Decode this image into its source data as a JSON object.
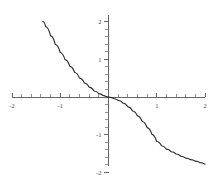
{
  "chart_data": {
    "type": "line",
    "title": "",
    "subtitle": "",
    "xlabel": "",
    "ylabel": "",
    "xlim": [
      -2,
      2
    ],
    "ylim": [
      -2,
      2
    ],
    "grid": false,
    "legend": null,
    "axes_style": "cartesian-crosshair",
    "curve_color": "#2b2b2b",
    "axis_color": "#555555",
    "background_color": "#ffffff",
    "x_ticks_major": [
      -2,
      -1,
      1,
      2
    ],
    "x_tick_labels": [
      "-2",
      "-1",
      "1",
      "2"
    ],
    "y_ticks_major": [
      -2,
      -1,
      1,
      2
    ],
    "y_tick_labels": [
      "-2",
      "-1",
      "1",
      "2"
    ],
    "minor_tick_step": 0.2,
    "series": [
      {
        "name": "curve",
        "description": "decreasing odd root function passing through origin",
        "x": [
          -1.36,
          -1.3,
          -1.2,
          -1.1,
          -1.0,
          -0.9,
          -0.8,
          -0.7,
          -0.6,
          -0.5,
          -0.4,
          -0.3,
          -0.2,
          -0.12,
          -0.06,
          -0.02,
          0.0,
          0.02,
          0.06,
          0.12,
          0.2,
          0.3,
          0.4,
          0.5,
          0.6,
          0.7,
          0.8,
          0.9,
          1.0,
          1.1,
          1.2,
          1.3,
          1.4,
          1.5,
          1.6,
          1.7,
          1.8,
          1.9,
          2.0
        ],
        "y": [
          2.0,
          1.86,
          1.62,
          1.39,
          1.18,
          0.99,
          0.81,
          0.65,
          0.5,
          0.37,
          0.26,
          0.16,
          0.09,
          0.045,
          0.018,
          0.004,
          0.0,
          -0.004,
          -0.018,
          -0.045,
          -0.09,
          -0.16,
          -0.26,
          -0.37,
          -0.5,
          -0.65,
          -0.81,
          -0.99,
          -1.18,
          -1.29,
          -1.38,
          -1.45,
          -1.51,
          -1.57,
          -1.62,
          -1.66,
          -1.7,
          -1.74,
          -1.78
        ]
      }
    ],
    "points_of_interest": [
      {
        "label": "origin",
        "x": 0,
        "y": 0
      }
    ]
  }
}
